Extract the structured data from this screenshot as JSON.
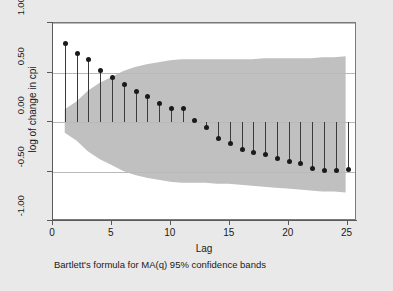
{
  "chart_data": {
    "type": "line",
    "title": "",
    "subtitle": "",
    "xlabel": "Lag",
    "ylabel": "log of change in cpi",
    "note": "Bartlett's formula for MA(q) 95% confidence bands",
    "xlim": [
      0,
      25.8
    ],
    "ylim": [
      -1.0,
      1.0
    ],
    "xticks": [
      0,
      5,
      10,
      15,
      20,
      25
    ],
    "xticklabels": [
      "0",
      "5",
      "10",
      "15",
      "20",
      "25"
    ],
    "yticks": [
      1.0,
      0.5,
      0.0,
      -0.5,
      -1.0
    ],
    "yticklabels": [
      "1.00",
      "0.50",
      "0.00",
      "-0.50",
      "-1.00"
    ],
    "grid": true,
    "grid_axis": "y",
    "legend": "none",
    "marker_style": "filled-circle",
    "plot_style": "stem-with-markers",
    "series": [
      {
        "name": "autocorrelation",
        "x": [
          1,
          2,
          3,
          4,
          5,
          6,
          7,
          8,
          9,
          10,
          11,
          12,
          13,
          14,
          15,
          16,
          17,
          18,
          19,
          20,
          21,
          22,
          23,
          24,
          25
        ],
        "values": [
          0.8,
          0.7,
          0.64,
          0.53,
          0.46,
          0.38,
          0.31,
          0.26,
          0.19,
          0.14,
          0.14,
          0.02,
          -0.05,
          -0.16,
          -0.21,
          -0.27,
          -0.3,
          -0.32,
          -0.36,
          -0.39,
          -0.41,
          -0.46,
          -0.48,
          -0.48,
          -0.47
        ]
      }
    ],
    "confidence_band": {
      "name": "Bartlett 95% confidence bands",
      "x": [
        1,
        2,
        3,
        4,
        5,
        6,
        7,
        8,
        9,
        10,
        11,
        12,
        13,
        14,
        15,
        16,
        17,
        18,
        19,
        20,
        21,
        22,
        23,
        24,
        25
      ],
      "upper": [
        0.12,
        0.2,
        0.31,
        0.39,
        0.45,
        0.51,
        0.55,
        0.58,
        0.6,
        0.62,
        0.63,
        0.63,
        0.63,
        0.63,
        0.63,
        0.63,
        0.63,
        0.64,
        0.64,
        0.64,
        0.64,
        0.64,
        0.65,
        0.65,
        0.66
      ],
      "lower": [
        -0.12,
        -0.2,
        -0.31,
        -0.39,
        -0.45,
        -0.51,
        -0.55,
        -0.58,
        -0.6,
        -0.62,
        -0.63,
        -0.63,
        -0.63,
        -0.64,
        -0.64,
        -0.65,
        -0.66,
        -0.67,
        -0.68,
        -0.69,
        -0.7,
        -0.71,
        -0.72,
        -0.72,
        -0.73
      ],
      "fill_color": "#c0c0c0"
    },
    "colors": {
      "band": "#c0c0c0",
      "marker": "#1a1a1a",
      "stem": "#3a3a3a",
      "grid": "#b9b9b9",
      "plot_background": "#ffffff",
      "figure_background": "#e9e9e9",
      "axis": "#5a5a5a"
    }
  }
}
